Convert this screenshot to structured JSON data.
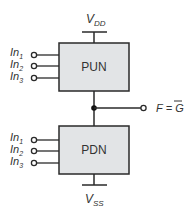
{
  "diagram": {
    "supply_top": {
      "main": "V",
      "sub": "DD"
    },
    "supply_bottom": {
      "main": "V",
      "sub": "SS"
    },
    "pun": {
      "label": "PUN",
      "inputs": [
        {
          "main": "In",
          "sub": "1"
        },
        {
          "main": "In",
          "sub": "2"
        },
        {
          "main": "In",
          "sub": "3"
        }
      ]
    },
    "pdn": {
      "label": "PDN",
      "inputs": [
        {
          "main": "In",
          "sub": "1"
        },
        {
          "main": "In",
          "sub": "2"
        },
        {
          "main": "In",
          "sub": "3"
        }
      ]
    },
    "output": {
      "lhs": "F",
      "eq": "=",
      "rhs": "G"
    },
    "colors": {
      "box_fill": "#e2e4e6",
      "stroke": "#2a2a2a"
    }
  }
}
